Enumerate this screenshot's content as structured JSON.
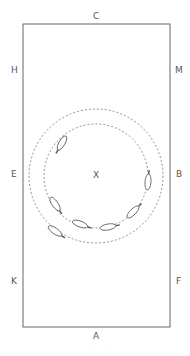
{
  "arena": {
    "markers": {
      "top": "C",
      "bottom": "A",
      "left_top": "H",
      "left_middle": "E",
      "left_bottom": "K",
      "right_top": "M",
      "right_middle": "B",
      "right_bottom": "F",
      "center": "X"
    },
    "border_color": "#666666",
    "circles": [
      {
        "name": "outer-circle",
        "radius": 67,
        "style": "dashed"
      },
      {
        "name": "inner-circle",
        "radius": 52,
        "style": "dashed"
      }
    ],
    "horse_count": 7
  },
  "caption": "· · · · · · ·"
}
